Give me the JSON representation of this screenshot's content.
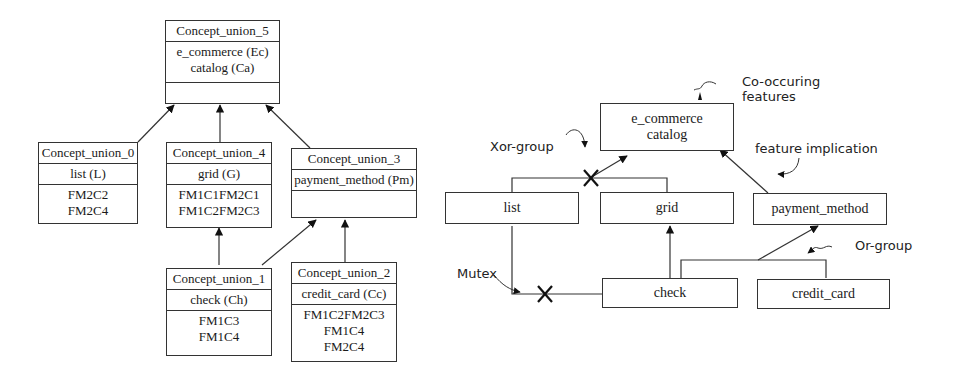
{
  "lattice": {
    "cu5": {
      "title": "Concept_union_5",
      "intent": [
        "e_commerce (Ec)",
        "catalog (Ca)"
      ],
      "extent": []
    },
    "cu0": {
      "title": "Concept_union_0",
      "intent": [
        "list (L)"
      ],
      "extent": [
        "FM2C2",
        "FM2C4"
      ]
    },
    "cu4": {
      "title": "Concept_union_4",
      "intent": [
        "grid (G)"
      ],
      "extent": [
        "FM1C1FM2C1",
        "FM1C2FM2C3"
      ]
    },
    "cu3": {
      "title": "Concept_union_3",
      "intent": [
        "payment_method (Pm)"
      ],
      "extent": []
    },
    "cu1": {
      "title": "Concept_union_1",
      "intent": [
        "check (Ch)"
      ],
      "extent": [
        "FM1C3",
        "FM1C4"
      ]
    },
    "cu2": {
      "title": "Concept_union_2",
      "intent": [
        "credit_card (Cc)"
      ],
      "extent": [
        "FM1C2FM2C3",
        "FM1C4",
        "FM2C4"
      ]
    }
  },
  "feature_model": {
    "root": [
      "e_commerce",
      "catalog"
    ],
    "list": "list",
    "grid": "grid",
    "payment_method": "payment_method",
    "check": "check",
    "credit_card": "credit_card"
  },
  "annotations": {
    "co_occurring": [
      "Co-occuring",
      "features"
    ],
    "xor_group": "Xor-group",
    "feature_implication": "feature implication",
    "or_group": "Or-group",
    "mutex": "Mutex"
  }
}
